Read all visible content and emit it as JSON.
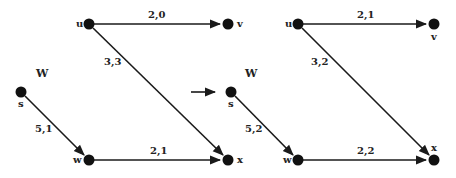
{
  "diagram": {
    "type": "flow-network-transformation",
    "transition_arrow": "right-arrow",
    "left_graph": {
      "set_label": "W",
      "nodes": [
        {
          "id": "u",
          "label": "u",
          "x": 89,
          "y": 24
        },
        {
          "id": "v",
          "label": "v",
          "x": 228,
          "y": 24
        },
        {
          "id": "s",
          "label": "s",
          "x": 21,
          "y": 92
        },
        {
          "id": "w",
          "label": "w",
          "x": 89,
          "y": 160
        },
        {
          "id": "x",
          "label": "x",
          "x": 228,
          "y": 160
        }
      ],
      "edges": [
        {
          "from": "u",
          "to": "v",
          "label": "2,0"
        },
        {
          "from": "u",
          "to": "x",
          "label": "3,3"
        },
        {
          "from": "s",
          "to": "w",
          "label": "5,1"
        },
        {
          "from": "w",
          "to": "x",
          "label": "2,1"
        }
      ]
    },
    "right_graph": {
      "set_label": "W",
      "nodes": [
        {
          "id": "u",
          "label": "u",
          "x": 298,
          "y": 24
        },
        {
          "id": "v",
          "label": "v",
          "x": 434,
          "y": 24
        },
        {
          "id": "s",
          "label": "s",
          "x": 231,
          "y": 92
        },
        {
          "id": "w",
          "label": "w",
          "x": 298,
          "y": 160
        },
        {
          "id": "x",
          "label": "x",
          "x": 434,
          "y": 160
        }
      ],
      "edges": [
        {
          "from": "u",
          "to": "v",
          "label": "2,1"
        },
        {
          "from": "u",
          "to": "x",
          "label": "3,2"
        },
        {
          "from": "s",
          "to": "w",
          "label": "5,2"
        },
        {
          "from": "w",
          "to": "x",
          "label": "2,2"
        }
      ]
    }
  }
}
